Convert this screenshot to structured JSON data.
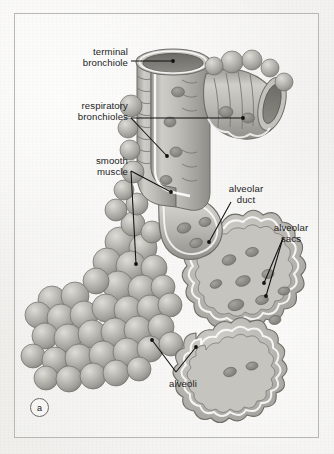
{
  "figure": {
    "domain_subject": "respiratory zone of the lung",
    "part_marker": "a",
    "background_color": "#f2f1ef",
    "border_color": "#b9b7b2",
    "ink_color": "#1d1d1d",
    "tissue_fill": "#b4b2ad",
    "tissue_shadow": "#8d8b86",
    "tissue_highlight": "#d2d0cb",
    "lumen_color": "#7d7b76"
  },
  "labels": [
    {
      "id": "terminal-bronchiole",
      "text_lines": [
        "terminal",
        "bronchiole"
      ],
      "line1": "terminal",
      "line2": "bronchiole",
      "align": "right",
      "x": 48,
      "y": 46,
      "width": 80
    },
    {
      "id": "respiratory-bronchioles",
      "text_lines": [
        "respiratory",
        "bronchioles"
      ],
      "line1": "respiratory",
      "line2": "bronchioles",
      "align": "right",
      "x": 40,
      "y": 100,
      "width": 88
    },
    {
      "id": "smooth-muscle",
      "text_lines": [
        "smooth",
        "muscle"
      ],
      "line1": "smooth",
      "line2": "muscle",
      "align": "right",
      "x": 48,
      "y": 155,
      "width": 80
    },
    {
      "id": "alveolar-duct",
      "text_lines": [
        "alveolar",
        "duct"
      ],
      "line1": "alveolar",
      "line2": "duct",
      "align": "center",
      "x": 216,
      "y": 183,
      "width": 60
    },
    {
      "id": "alveolar-sacs",
      "text_lines": [
        "alveolar",
        "sacs"
      ],
      "line1": "alveolar",
      "line2": "sacs",
      "align": "center",
      "x": 262,
      "y": 222,
      "width": 58
    },
    {
      "id": "alveoli",
      "text_lines": [
        "alveoli"
      ],
      "line1": "alveoli",
      "line2": "",
      "align": "center",
      "x": 158,
      "y": 378,
      "width": 50
    }
  ]
}
